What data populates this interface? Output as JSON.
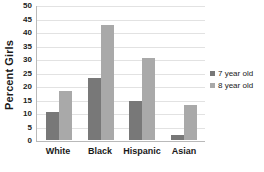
{
  "chart_data": {
    "type": "bar",
    "title": "",
    "subtitle": "",
    "xlabel": "",
    "ylabel": "Percent Girls",
    "categories": [
      "White",
      "Black",
      "Hispanic",
      "Asian"
    ],
    "series": [
      {
        "name": "7 year old",
        "color": "#787878",
        "values": [
          10.3,
          23.0,
          14.5,
          1.8
        ]
      },
      {
        "name": "8 year old",
        "color": "#a9a9a9",
        "values": [
          18.0,
          42.5,
          30.5,
          13.0
        ]
      }
    ],
    "ylim": [
      0,
      50
    ],
    "ytick_interval": 5,
    "yticks": [
      0,
      5,
      10,
      15,
      20,
      25,
      30,
      35,
      40,
      45,
      50
    ],
    "ytick_labels": [
      "0",
      "5",
      "10",
      "15",
      "20",
      "25",
      "30",
      "35",
      "40",
      "45",
      "50"
    ],
    "grid": true,
    "grid_axis": "y",
    "legend_position": "right",
    "legend_entries": [
      "7 year old",
      "8 year old"
    ]
  }
}
